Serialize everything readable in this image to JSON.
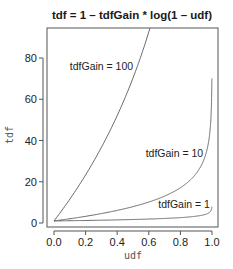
{
  "chart_data": {
    "type": "line",
    "title": "tdf = 1 – tdfGain * log(1 – udf)",
    "xlabel": "udf",
    "ylabel": "tdf",
    "xlim": [
      0,
      1
    ],
    "ylim": [
      0,
      94.5
    ],
    "x_ticks": [
      0.0,
      0.2,
      0.4,
      0.6,
      0.8,
      1.0
    ],
    "x_tick_labels": [
      "0.0",
      "0.2",
      "0.4",
      "0.6",
      "0.8",
      "1.0"
    ],
    "y_ticks": [
      0,
      20,
      40,
      60,
      80
    ],
    "y_tick_labels": [
      "0",
      "20",
      "40",
      "60",
      "80"
    ],
    "grid": false,
    "legend": "none",
    "formula": "tdf = 1 - tdfGain * ln(1 - udf)",
    "udf_range": [
      0,
      0.999
    ],
    "series": [
      {
        "name": "tdfGain = 100",
        "gain": 100,
        "label": "tdfGain = 100",
        "label_pos": [
          0.1,
          74
        ]
      },
      {
        "name": "tdfGain = 10",
        "gain": 10,
        "label": "tdfGain = 10",
        "label_pos": [
          0.58,
          32
        ]
      },
      {
        "name": "tdfGain = 1",
        "gain": 1,
        "label": "tdfGain = 1",
        "label_pos": [
          0.66,
          7.5
        ]
      }
    ],
    "sample_points": {
      "tdfGain = 100": {
        "x": [
          0,
          0.1,
          0.2,
          0.3,
          0.4,
          0.5,
          0.6
        ],
        "y": [
          1,
          11.5,
          23.3,
          36.7,
          52.1,
          70.3,
          92.6
        ]
      },
      "tdfGain = 10": {
        "x": [
          0,
          0.2,
          0.4,
          0.6,
          0.8,
          0.9,
          0.99,
          0.999
        ],
        "y": [
          1,
          3.2,
          6.1,
          10.2,
          17.1,
          24.0,
          47.1,
          70.1
        ]
      },
      "tdfGain = 1": {
        "x": [
          0,
          0.2,
          0.4,
          0.6,
          0.8,
          0.9,
          0.99,
          0.999
        ],
        "y": [
          1,
          1.2,
          1.5,
          1.9,
          2.6,
          3.3,
          5.6,
          7.9
        ]
      }
    }
  },
  "colors": {
    "curve": "#666666",
    "frame": "#555555",
    "text": "#222222"
  }
}
